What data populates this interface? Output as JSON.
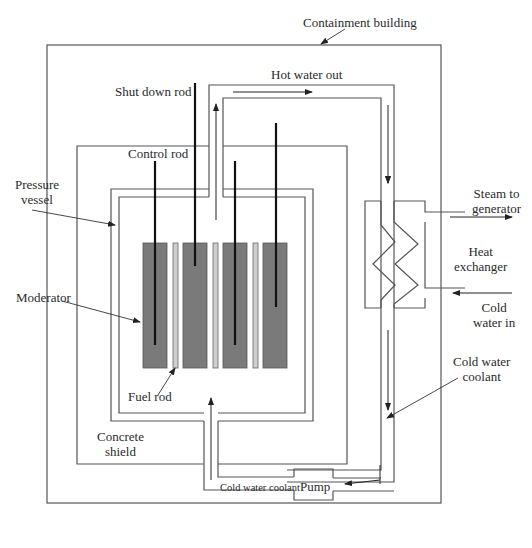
{
  "diagram": {
    "labels": {
      "containment_building": "Containment building",
      "hot_water_out": "Hot water out",
      "shut_down_rod": "Shut down rod",
      "control_rod": "Control rod",
      "pressure_vessel_1": "Pressure",
      "pressure_vessel_2": "vessel",
      "moderator": "Moderator",
      "fuel_rod": "Fuel rod",
      "concrete_shield_1": "Concrete",
      "concrete_shield_2": "shield",
      "steam_to_generator_1": "Steam to",
      "steam_to_generator_2": "generator",
      "heat_exchanger_1": "Heat",
      "heat_exchanger_2": "exchanger",
      "cold_water_in_1": "Cold",
      "cold_water_in_2": "water in",
      "cold_water_coolant_1": "Cold water",
      "cold_water_coolant_2": "coolant",
      "cold_water_coolant_bottom": "Cold water coolant",
      "pump": "Pump"
    },
    "colors": {
      "line": "#555555",
      "rod": "#111111",
      "moderator_fill": "#7a7a7a",
      "fuel_rod_fill": "#cfcfcf"
    }
  }
}
